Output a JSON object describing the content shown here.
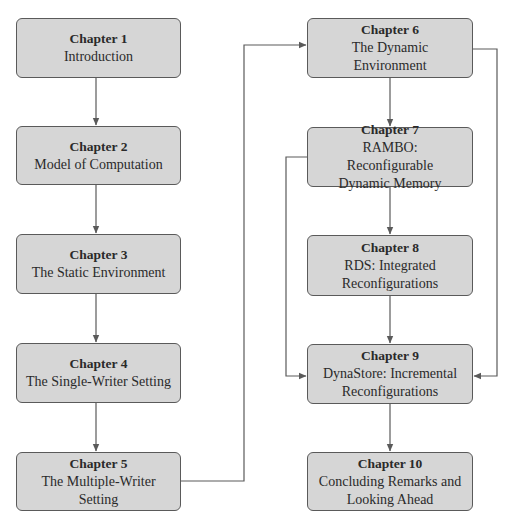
{
  "diagram": {
    "type": "flowchart",
    "colors": {
      "box_fill": "#d6d6d6",
      "box_border": "#5a5a5a",
      "connector": "#5a5a5a",
      "background": "#ffffff"
    },
    "nodes": [
      {
        "id": "ch1",
        "label": "Chapter 1",
        "title": "Introduction"
      },
      {
        "id": "ch2",
        "label": "Chapter 2",
        "title": "Model of Computation"
      },
      {
        "id": "ch3",
        "label": "Chapter 3",
        "title": "The Static Environment"
      },
      {
        "id": "ch4",
        "label": "Chapter 4",
        "title": "The Single-Writer Setting"
      },
      {
        "id": "ch5",
        "label": "Chapter 5",
        "title": "The Multiple-Writer Setting"
      },
      {
        "id": "ch6",
        "label": "Chapter 6",
        "title": "The Dynamic Environment"
      },
      {
        "id": "ch7",
        "label": "Chapter 7",
        "title": "RAMBO: Reconfigurable Dynamic Memory"
      },
      {
        "id": "ch8",
        "label": "Chapter 8",
        "title": "RDS: Integrated Reconfigurations"
      },
      {
        "id": "ch9",
        "label": "Chapter 9",
        "title": "DynaStore: Incremental Reconfigurations"
      },
      {
        "id": "ch10",
        "label": "Chapter 10",
        "title": "Concluding Remarks and Looking Ahead"
      }
    ],
    "edges": [
      {
        "from": "ch1",
        "to": "ch2"
      },
      {
        "from": "ch2",
        "to": "ch3"
      },
      {
        "from": "ch3",
        "to": "ch4"
      },
      {
        "from": "ch4",
        "to": "ch5"
      },
      {
        "from": "ch5",
        "to": "ch6"
      },
      {
        "from": "ch6",
        "to": "ch7"
      },
      {
        "from": "ch6",
        "to": "ch9"
      },
      {
        "from": "ch7",
        "to": "ch8"
      },
      {
        "from": "ch7",
        "to": "ch9"
      },
      {
        "from": "ch8",
        "to": "ch9"
      },
      {
        "from": "ch9",
        "to": "ch10"
      }
    ]
  }
}
